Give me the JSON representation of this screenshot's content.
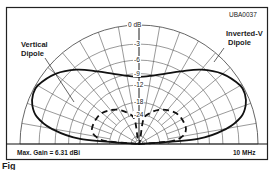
{
  "chart_data": {
    "type": "polar",
    "title": "",
    "figure_id": "UBA0037",
    "frequency_label": "10 MHz",
    "max_gain_label": "Max. Gain = 6.31 dBi",
    "radial_scale": "ARRL log-periodic (dB)",
    "ring_labels": [
      "0 dB",
      "-3",
      "-6",
      "-9",
      "-12",
      "-18",
      "-24"
    ],
    "ring_values_db": [
      0,
      -3,
      -6,
      -9,
      -12,
      -18,
      -24,
      -30
    ],
    "angle_range_deg": [
      0,
      180
    ],
    "angle_step_deg": 10,
    "grid": true,
    "series": [
      {
        "name": "Inverted-V Dipole",
        "style": "solid",
        "elevation_deg": [
          0,
          5,
          10,
          15,
          20,
          25,
          30,
          40,
          50,
          60,
          70,
          80,
          90,
          100,
          110,
          120,
          130,
          140,
          150,
          155,
          160,
          165,
          170,
          175,
          180
        ],
        "gain_db": [
          -40,
          -12,
          -5,
          -2,
          -0.8,
          -0.3,
          -0.3,
          -1.5,
          -3.5,
          -6,
          -8,
          -9.3,
          -9.8,
          -9.3,
          -8,
          -6,
          -3.5,
          -1.5,
          -0.3,
          -0.3,
          -0.8,
          -2,
          -5,
          -12,
          -40
        ]
      },
      {
        "name": "Vertical Dipole",
        "style": "dashed",
        "elevation_deg": [
          0,
          5,
          10,
          15,
          20,
          30,
          40,
          50,
          60,
          70,
          80,
          90,
          100,
          110,
          120,
          130,
          140,
          150,
          160,
          165,
          170,
          175,
          180
        ],
        "gain_db": [
          -40,
          -22,
          -17,
          -15.5,
          -15,
          -15,
          -15.5,
          -17,
          -19,
          -22,
          -27,
          -40,
          -27,
          -22,
          -19,
          -17,
          -15.5,
          -15,
          -15,
          -15.5,
          -17,
          -22,
          -40
        ]
      }
    ],
    "annotations": [
      {
        "text": "Vertical\nDipole",
        "line1": "Vertical",
        "line2": "Dipole",
        "points_to": "Vertical Dipole"
      },
      {
        "text": "Inverted-V\nDipole",
        "line1": "Inverted-V",
        "line2": "Dipole",
        "points_to": "Inverted-V Dipole"
      }
    ],
    "caption_fragment": "Fig"
  }
}
